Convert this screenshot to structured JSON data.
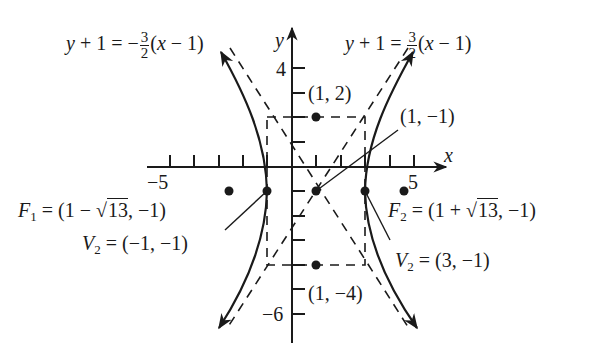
{
  "figure": {
    "axes": {
      "x_label": "x",
      "y_label": "y",
      "x_tick_label_neg": "−5",
      "x_tick_label_pos": "5",
      "y_tick_label_pos": "4",
      "y_tick_label_neg": "−6"
    },
    "asymptotes": {
      "left": {
        "lhs": "y + 1 = −",
        "num": "3",
        "den": "2",
        "rhs": "(x − 1)"
      },
      "right": {
        "lhs": "y + 1 = ",
        "num": "3",
        "den": "2",
        "rhs": "(x − 1)"
      }
    },
    "points": {
      "top_rect": "(1, 2)",
      "center": "(1, −1)",
      "bottom_rect": "(1, −4)"
    },
    "foci": {
      "f1": {
        "name": "F",
        "sub": "1",
        "pre": " = (1 − ",
        "root": "13",
        "post": ", −1)"
      },
      "f2": {
        "name": "F",
        "sub": "2",
        "pre": " = (1 + ",
        "root": "13",
        "post": ", −1)"
      }
    },
    "vertices": {
      "v_left": {
        "name": "V",
        "sub": "2",
        "value": " = (−1, −1)"
      },
      "v_right": {
        "name": "V",
        "sub": "2",
        "value": " = (3, −1)"
      }
    },
    "colors": {
      "ink": "#1a1a1a",
      "background": "#ffffff"
    }
  }
}
